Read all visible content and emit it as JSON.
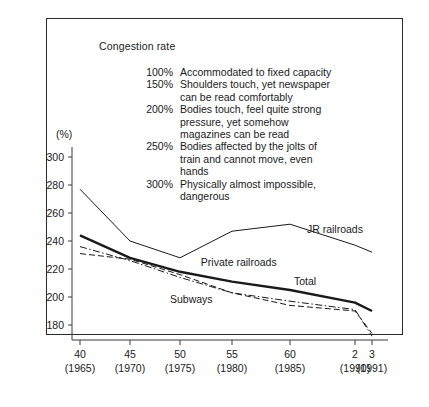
{
  "chart_data": {
    "type": "line",
    "title": "Congestion rate",
    "xlabel": "",
    "ylabel": "(%)",
    "ylim": [
      173,
      304
    ],
    "xlim": [
      1965,
      1991
    ],
    "grid": false,
    "legend_position": "inline-labels",
    "y_ticks": [
      300,
      280,
      260,
      240,
      220,
      200,
      180
    ],
    "x_ticks": [
      {
        "label": "40",
        "year": "(1965)",
        "x": 1965
      },
      {
        "label": "45",
        "year": "(1970)",
        "x": 1970
      },
      {
        "label": "50",
        "year": "(1975)",
        "x": 1975
      },
      {
        "label": "55",
        "year": "(1980)",
        "x": 1980
      },
      {
        "label": "60",
        "year": "(1985)",
        "x": 1985
      },
      {
        "label": "2",
        "year": "(1990)",
        "x": 1990
      },
      {
        "label": "3",
        "year": "(1991)",
        "x": 1991
      }
    ],
    "x": [
      1965,
      1970,
      1975,
      1980,
      1985,
      1990,
      1991
    ],
    "series": [
      {
        "name": "JR railroads",
        "style": "solid-thin",
        "values": [
          277,
          240,
          228,
          247,
          252,
          237,
          232
        ]
      },
      {
        "name": "Total",
        "style": "solid-thick",
        "values": [
          244,
          228,
          218,
          211,
          205,
          196,
          190
        ]
      },
      {
        "name": "Private railroads",
        "style": "dash-dot",
        "values": [
          236,
          226,
          214,
          203,
          197,
          191,
          172
        ]
      },
      {
        "name": "Subways",
        "style": "dashed",
        "values": [
          231,
          227,
          216,
          203,
          194,
          190,
          174
        ]
      }
    ],
    "annotations": [
      {
        "text": "JR railroads",
        "x": 1986.3,
        "y": 248
      },
      {
        "text": "Private railroads",
        "x": 1977.0,
        "y": 224
      },
      {
        "text": "Total",
        "x": 1985.3,
        "y": 211
      },
      {
        "text": "Subways",
        "x": 1974.0,
        "y": 198
      }
    ]
  },
  "notes": [
    {
      "pct": "100%",
      "lines": [
        "Accommodated to fixed capacity"
      ]
    },
    {
      "pct": "150%",
      "lines": [
        "Shoulders touch, yet newspaper",
        "can be read comfortably"
      ]
    },
    {
      "pct": "200%",
      "lines": [
        "Bodies touch, feel quite strong",
        "pressure, yet somehow",
        "magazines can be read"
      ]
    },
    {
      "pct": "250%",
      "lines": [
        "Bodies affected by the jolts of",
        "train and cannot move, even",
        "hands"
      ]
    },
    {
      "pct": "300%",
      "lines": [
        "Physically almost impossible,",
        "dangerous"
      ]
    }
  ],
  "colors": {
    "ink": "#1a1a1a",
    "frame": "#2b2b2b",
    "axis": "#3a3a3a",
    "background": "#ffffff"
  }
}
